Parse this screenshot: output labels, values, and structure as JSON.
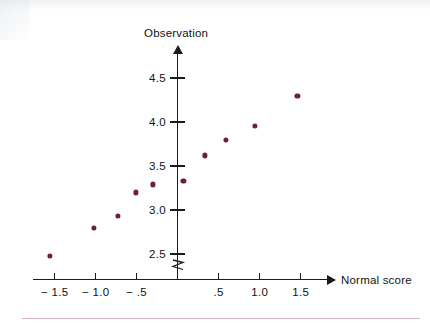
{
  "chart_data": {
    "type": "scatter",
    "title": "",
    "xlabel": "Normal score",
    "ylabel": "Observation",
    "xlim": [
      -1.75,
      1.85
    ],
    "ylim": [
      2.35,
      4.72
    ],
    "grid": false,
    "legend": "none",
    "axis_break": "y-axis break below 2.5",
    "marker_color": "#6b2234",
    "axis_color": "#1b1b1b",
    "x_ticks": [
      {
        "value": -1.5,
        "label": "− 1.5"
      },
      {
        "value": -1.0,
        "label": "− 1.0"
      },
      {
        "value": -0.5,
        "label": "− .5"
      },
      {
        "value": 0.0,
        "label": ""
      },
      {
        "value": 0.5,
        "label": ".5"
      },
      {
        "value": 1.0,
        "label": "1.0"
      },
      {
        "value": 1.5,
        "label": "1.5"
      }
    ],
    "y_ticks": [
      {
        "value": 4.5,
        "label": "4.5"
      },
      {
        "value": 4.0,
        "label": "4.0"
      },
      {
        "value": 3.5,
        "label": "3.5"
      },
      {
        "value": 3.0,
        "label": "3.0"
      },
      {
        "value": 2.5,
        "label": "2.5"
      }
    ],
    "points": [
      {
        "x": -1.56,
        "y": 2.48
      },
      {
        "x": -1.02,
        "y": 2.8
      },
      {
        "x": -0.73,
        "y": 2.93
      },
      {
        "x": -0.51,
        "y": 3.2
      },
      {
        "x": -0.3,
        "y": 3.29
      },
      {
        "x": 0.07,
        "y": 3.33
      },
      {
        "x": 0.33,
        "y": 3.62
      },
      {
        "x": 0.59,
        "y": 3.8
      },
      {
        "x": 0.94,
        "y": 3.96
      },
      {
        "x": 1.46,
        "y": 4.3
      }
    ]
  }
}
